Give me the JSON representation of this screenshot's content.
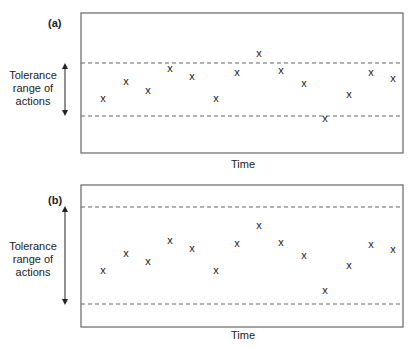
{
  "chart_data": [
    {
      "type": "scatter",
      "panel_label": "(a)",
      "xlabel": "Time",
      "ylabel": "",
      "marker": "x",
      "tolerance_label": [
        "Tolerance",
        "range of",
        "actions"
      ],
      "tolerance_band_px": {
        "upper": 63,
        "lower": 116
      },
      "box_px": {
        "left": 81,
        "top": 13,
        "right": 403,
        "bottom": 153
      },
      "points_px": [
        [
          103,
          98
        ],
        [
          126,
          81
        ],
        [
          148,
          90
        ],
        [
          170,
          68
        ],
        [
          192,
          76
        ],
        [
          216,
          98
        ],
        [
          237,
          72
        ],
        [
          259,
          53
        ],
        [
          281,
          70
        ],
        [
          304,
          83
        ],
        [
          325,
          118
        ],
        [
          349,
          94
        ],
        [
          371,
          72
        ],
        [
          393,
          78
        ]
      ],
      "note": "Narrow tolerance range: two points fall outside the band (one above, one below)."
    },
    {
      "type": "scatter",
      "panel_label": "(b)",
      "xlabel": "Time",
      "ylabel": "",
      "marker": "x",
      "tolerance_label": [
        "Tolerance",
        "range of",
        "actions"
      ],
      "tolerance_band_px": {
        "upper": 207,
        "lower": 304
      },
      "box_px": {
        "left": 81,
        "top": 185,
        "right": 403,
        "bottom": 327
      },
      "points_px": [
        [
          103,
          270
        ],
        [
          126,
          253
        ],
        [
          148,
          261
        ],
        [
          170,
          240
        ],
        [
          192,
          248
        ],
        [
          216,
          270
        ],
        [
          237,
          243
        ],
        [
          259,
          225
        ],
        [
          281,
          242
        ],
        [
          304,
          255
        ],
        [
          325,
          290
        ],
        [
          349,
          265
        ],
        [
          371,
          244
        ],
        [
          393,
          249
        ]
      ],
      "note": "Wide tolerance range: all points fall within the band."
    }
  ],
  "panels": {
    "a": {
      "label": "(a)",
      "xlabel": "Time",
      "tol1": "Tolerance",
      "tol2": "range of",
      "tol3": "actions"
    },
    "b": {
      "label": "(b)",
      "xlabel": "Time",
      "tol1": "Tolerance",
      "tol2": "range of",
      "tol3": "actions"
    }
  },
  "marker_glyph": "x",
  "colors": {
    "line": "#555555",
    "text": "#222222",
    "dash": "#666666"
  }
}
